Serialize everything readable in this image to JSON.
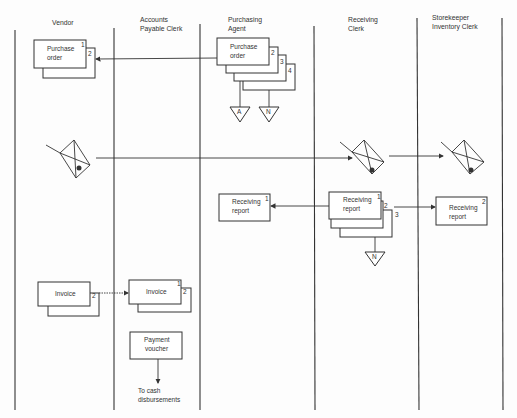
{
  "diagram": {
    "type": "document flowchart (swimlane)",
    "lanes": [
      {
        "id": "vendor",
        "header": [
          "Vendor"
        ]
      },
      {
        "id": "ap",
        "header": [
          "Accounts",
          "Payable Clerk"
        ]
      },
      {
        "id": "purchasing",
        "header": [
          "Purchasing",
          "Agent"
        ]
      },
      {
        "id": "receiving",
        "header": [
          "Receiving",
          "Clerk"
        ]
      },
      {
        "id": "storekeeper",
        "header": [
          "Storekeeper",
          "Inventory Clerk"
        ]
      }
    ],
    "documents": {
      "vendor_po": {
        "text": [
          "Purchase",
          "order"
        ],
        "copies": [
          "1",
          "2"
        ]
      },
      "agent_po": {
        "text": [
          "Purchase",
          "order"
        ],
        "copies": [
          "2",
          "3",
          "4"
        ]
      },
      "agent_rr": {
        "text": [
          "Receiving",
          "report"
        ],
        "copies": [
          "1"
        ]
      },
      "recv_rr": {
        "text": [
          "Receiving",
          "report"
        ],
        "copies": [
          "1",
          "2",
          "3"
        ]
      },
      "store_rr": {
        "text": [
          "Receiving",
          "report"
        ],
        "copies": [
          "2"
        ]
      },
      "vendor_inv": {
        "text": [
          "Invoice"
        ],
        "copies": [
          "2"
        ]
      },
      "ap_inv": {
        "text": [
          "Invoice"
        ],
        "copies": [
          "1",
          "2"
        ]
      },
      "voucher": {
        "text": [
          "Payment",
          "voucher"
        ]
      }
    },
    "files": {
      "a": "A",
      "n1": "N",
      "n2": "N"
    },
    "terminal": [
      "To cash",
      "disbursements"
    ],
    "symbols": [
      "goods-cart-vendor",
      "goods-cart-receiving",
      "goods-cart-storekeeper"
    ]
  }
}
